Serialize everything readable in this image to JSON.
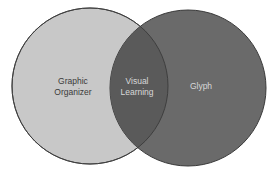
{
  "diagram": {
    "type": "venn",
    "sets": [
      {
        "label_lines": [
          "Graphic",
          "Organizer"
        ],
        "fill": "#c8c8c8",
        "text_color": "#3a3a3a"
      },
      {
        "label_lines": [
          "Glyph"
        ],
        "fill": "#6a6a6a",
        "text_color": "#d8d8d8"
      }
    ],
    "intersection": {
      "label_lines": [
        "Visual",
        "Learning"
      ],
      "fill": "#5a5a5a",
      "text_color": "#d8d8d8"
    },
    "stroke": "#4a4a4a"
  }
}
